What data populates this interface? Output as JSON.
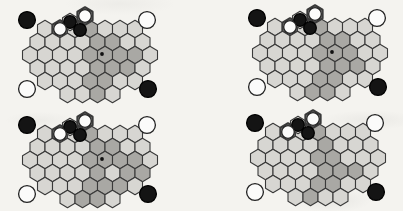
{
  "figure": {
    "panels": 4,
    "panel_names": [
      "top-left",
      "top-right",
      "bottom-left",
      "bottom-right"
    ]
  },
  "palette": {
    "paper": "#f4f3ef",
    "cell_light": "#d7d6d2",
    "cell_dark": "#a9a8a4",
    "line": "#3a3a3a",
    "stone_black": "#141414",
    "stone_white": "#fbfbfa",
    "dot": "#111111"
  },
  "geometry": {
    "hex_width": 15,
    "hex_height": 17.4,
    "row_step": 13,
    "row_counts": [
      7,
      8,
      9,
      8,
      7,
      4
    ],
    "row_start_dx": [
      -45,
      -52.5,
      -60,
      -52.5,
      -45,
      -22.5
    ],
    "row_dy": [
      -26,
      -13,
      0,
      13,
      26,
      39
    ],
    "board_stone_radius": 6.3,
    "corner_stone_radius": 8.4,
    "center_dot_radius": 1.9,
    "center_dot_cell": [
      2,
      5
    ],
    "thin_stroke": 1.1,
    "thick_stroke": 2.3
  },
  "cluster": {
    "floating_cells": [
      {
        "name": "black-probe-hex",
        "dx": -20,
        "dy": -33,
        "thick": false
      },
      {
        "name": "white-top-hex",
        "dx": -5,
        "dy": -39,
        "thick": true
      }
    ],
    "thick_board_cell": [
      0,
      1
    ],
    "stones": [
      {
        "color": "black",
        "dx": -20,
        "dy": -33
      },
      {
        "color": "white",
        "dx": -5,
        "dy": -39
      },
      {
        "color": "white",
        "dx": -30,
        "dy": -26
      },
      {
        "color": "black",
        "dx": -10,
        "dy": -25
      }
    ]
  },
  "corner_stones": [
    {
      "pos": "top-left",
      "color": "black",
      "dx": -63,
      "dy": -35
    },
    {
      "pos": "top-right",
      "color": "white",
      "dx": 57,
      "dy": -35
    },
    {
      "pos": "bottom-left",
      "color": "white",
      "dx": -63,
      "dy": 34
    },
    {
      "pos": "bottom-right",
      "color": "black",
      "dx": 58,
      "dy": 34
    }
  ],
  "boards": [
    {
      "name": "top-left",
      "cx": 90,
      "cy": 55,
      "has_center_dot": true,
      "dark_cells": [
        [
          0,
          3
        ],
        [
          1,
          4
        ],
        [
          1,
          5
        ],
        [
          2,
          4
        ],
        [
          2,
          5
        ],
        [
          2,
          6
        ],
        [
          2,
          7
        ],
        [
          3,
          4
        ],
        [
          3,
          5
        ],
        [
          3,
          6
        ],
        [
          4,
          3
        ],
        [
          4,
          4
        ],
        [
          5,
          2
        ]
      ]
    },
    {
      "name": "top-right",
      "cx": 320,
      "cy": 53,
      "has_center_dot": true,
      "dark_cells": [
        [
          0,
          3
        ],
        [
          1,
          4
        ],
        [
          1,
          5
        ],
        [
          2,
          4
        ],
        [
          2,
          5
        ],
        [
          2,
          6
        ],
        [
          3,
          4
        ],
        [
          3,
          5
        ],
        [
          3,
          6
        ],
        [
          4,
          3
        ],
        [
          4,
          4
        ],
        [
          5,
          1
        ],
        [
          5,
          2
        ]
      ]
    },
    {
      "name": "bottom-left",
      "cx": 90,
      "cy": 160,
      "has_center_dot": true,
      "dark_cells": [
        [
          0,
          3
        ],
        [
          1,
          4
        ],
        [
          1,
          5
        ],
        [
          2,
          4
        ],
        [
          2,
          5
        ],
        [
          2,
          6
        ],
        [
          2,
          7
        ],
        [
          3,
          4
        ],
        [
          3,
          6
        ],
        [
          3,
          7
        ],
        [
          4,
          3
        ],
        [
          4,
          4
        ],
        [
          4,
          5
        ],
        [
          5,
          1
        ],
        [
          5,
          2
        ]
      ]
    },
    {
      "name": "bottom-right",
      "cx": 318,
      "cy": 158,
      "has_center_dot": false,
      "dark_cells": [
        [
          0,
          3
        ],
        [
          1,
          4
        ],
        [
          2,
          4
        ],
        [
          2,
          5
        ],
        [
          3,
          4
        ],
        [
          3,
          5
        ],
        [
          3,
          6
        ],
        [
          4,
          3
        ],
        [
          4,
          4
        ],
        [
          5,
          1
        ]
      ]
    }
  ]
}
